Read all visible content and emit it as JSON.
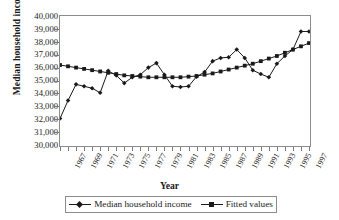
{
  "chart_data": {
    "type": "line",
    "title": "",
    "xlabel": "Year",
    "ylabel": "Median household income",
    "ylim": [
      30000,
      40000
    ],
    "ytick_step": 1000,
    "ytick_labels": [
      "40,000",
      "39,000",
      "38,000",
      "37,000",
      "36,000",
      "35,000",
      "34,000",
      "33,000",
      "32,000",
      "31,000",
      "30,000"
    ],
    "grid": false,
    "legend_position": "bottom",
    "x": [
      1967,
      1968,
      1969,
      1970,
      1971,
      1972,
      1973,
      1974,
      1975,
      1976,
      1977,
      1978,
      1979,
      1980,
      1981,
      1982,
      1983,
      1984,
      1985,
      1986,
      1987,
      1988,
      1989,
      1990,
      1991,
      1992,
      1993,
      1994,
      1995,
      1996,
      1997,
      1998
    ],
    "xtick_labels": [
      "1967",
      "1969",
      "1971",
      "1973",
      "1975",
      "1977",
      "1979",
      "1981",
      "1983",
      "1985",
      "1987",
      "1989",
      "1991",
      "1993",
      "1995",
      "1997"
    ],
    "series": [
      {
        "name": "Median household income",
        "marker": "diamond",
        "values": [
          32050,
          33450,
          34700,
          34550,
          34400,
          34050,
          35750,
          35400,
          34800,
          35250,
          35450,
          36000,
          36350,
          35450,
          34550,
          34500,
          34550,
          35300,
          35650,
          36500,
          36750,
          36800,
          37400,
          36750,
          35800,
          35500,
          35250,
          36300,
          36900,
          37400,
          38800,
          38800
        ]
      },
      {
        "name": "Fitted values",
        "marker": "square",
        "values": [
          36200,
          36100,
          36000,
          35900,
          35800,
          35700,
          35600,
          35500,
          35400,
          35350,
          35300,
          35250,
          35250,
          35250,
          35250,
          35250,
          35300,
          35350,
          35450,
          35550,
          35700,
          35850,
          36000,
          36150,
          36300,
          36500,
          36700,
          36900,
          37150,
          37400,
          37650,
          37900
        ]
      }
    ]
  },
  "legend": {
    "items": [
      {
        "label": "Median household income",
        "marker": "diamond"
      },
      {
        "label": "Fitted values",
        "marker": "square"
      }
    ]
  }
}
